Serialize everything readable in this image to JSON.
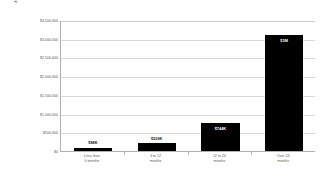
{
  "chart_data": {
    "type": "bar",
    "title": "",
    "xlabel": "",
    "ylabel": "Average budget (estimated, in US$)",
    "categories": [
      "Less than\n6 months",
      "6 to 12\nmonths",
      "12 to 24\nmonths",
      "Over 24\nmonths"
    ],
    "values": [
      88000,
      209000,
      744000,
      3100000
    ],
    "value_labels": [
      "$88K",
      "$209K",
      "$744K",
      "$3M"
    ],
    "ylim": [
      0,
      3500000
    ],
    "ytick_values": [
      0,
      500000,
      1000000,
      1500000,
      2000000,
      2500000,
      3000000,
      3500000
    ],
    "ytick_labels": [
      "$0",
      "$500,000",
      "$1,000,000",
      "$1,500,000",
      "$2,000,000",
      "$2,500,000",
      "$3,000,000",
      "$3,500,000"
    ],
    "grid": true,
    "legend": null,
    "bar_color": "#000000",
    "grid_color": "#d9d9d9",
    "axis_color": "#b0b0b0",
    "text_color": "#5a5a5a"
  }
}
